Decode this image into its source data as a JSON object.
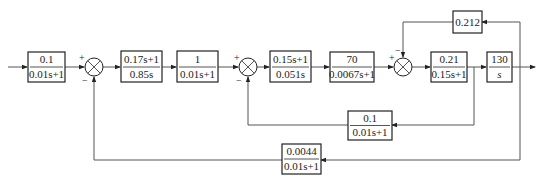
{
  "diagram": {
    "type": "control-system-block-diagram",
    "forward_path": [
      {
        "id": "b1",
        "num": "0.1",
        "den": "0.01s+1"
      },
      {
        "id": "b2",
        "num": "0.17s+1",
        "den": "0.85s"
      },
      {
        "id": "b3",
        "num": "1",
        "den": "0.01s+1"
      },
      {
        "id": "b4",
        "num": "0.15s+1",
        "den": "0.051s"
      },
      {
        "id": "b5",
        "num": "70",
        "den": "0.0067s+1"
      },
      {
        "id": "b6",
        "num": "0.21",
        "den": "0.15s+1"
      },
      {
        "id": "b7",
        "num": "130",
        "den": "s"
      }
    ],
    "feedback": {
      "top": {
        "gain": "0.212"
      },
      "inner": {
        "num": "0.1",
        "den": "0.01s+1"
      },
      "outer": {
        "num": "0.0044",
        "den": "0.01s+1"
      }
    },
    "summers": [
      {
        "id": "s1",
        "plus": "+",
        "minus": "−"
      },
      {
        "id": "s2",
        "plus": "+",
        "minus": "−"
      },
      {
        "id": "s3",
        "plus": "+",
        "minus": "−"
      }
    ]
  }
}
